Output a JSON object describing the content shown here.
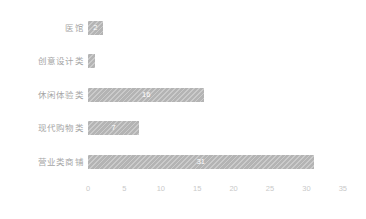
{
  "chart_data": {
    "type": "bar",
    "orientation": "horizontal",
    "title": "",
    "xlabel": "",
    "ylabel": "",
    "categories": [
      "医馆",
      "创意设计类",
      "休闲体验类",
      "现代购物类",
      "营业类商铺"
    ],
    "values": [
      2,
      1,
      16,
      7,
      31
    ],
    "value_labels": [
      "2",
      "1",
      "16",
      "7",
      "31"
    ],
    "xlim": [
      0,
      35
    ],
    "xticks": [
      0,
      5,
      10,
      15,
      20,
      25,
      30,
      35
    ],
    "xtick_labels": [
      "0",
      "5",
      "10",
      "15",
      "20",
      "25",
      "30",
      "35"
    ],
    "grid": false,
    "legend": false,
    "bar_color": "#b4b4b4",
    "bar_pattern": "diagonal-hatch",
    "value_label_color": "#ffffff",
    "category_label_color": "#a6a6a6",
    "tick_label_color": "#c9c9c9",
    "background_color": "#ffffff"
  }
}
